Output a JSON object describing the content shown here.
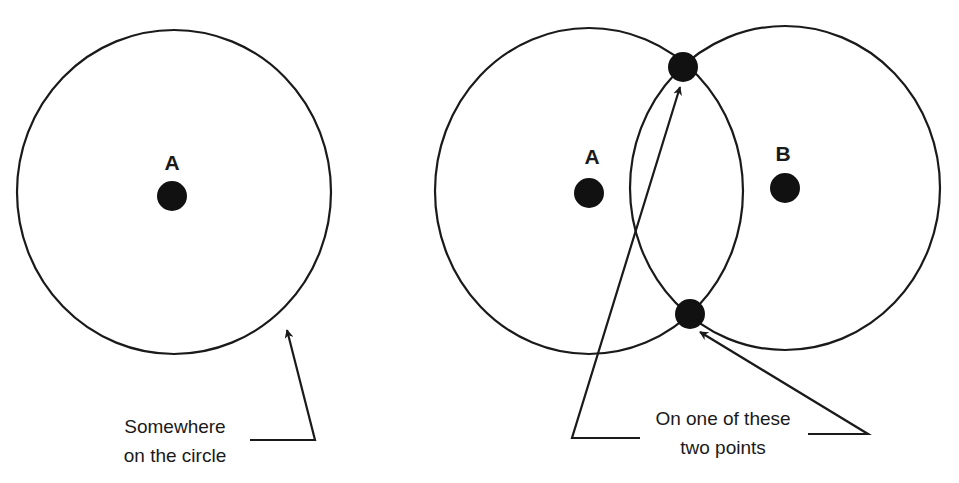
{
  "colors": {
    "background": "#ffffff",
    "ink": "#1a1a1a"
  },
  "left_figure": {
    "point_label": "A",
    "caption_line1": "Somewhere",
    "caption_line2": "on the circle"
  },
  "right_figure": {
    "point_a_label": "A",
    "point_b_label": "B",
    "caption_line1": "On one of these",
    "caption_line2": "two points"
  }
}
